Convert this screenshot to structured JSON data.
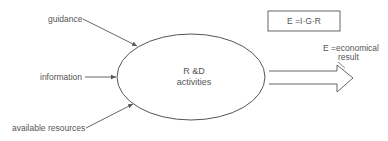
{
  "diagram": {
    "inputs": [
      {
        "id": "guidance",
        "label": "guidance"
      },
      {
        "id": "information",
        "label": "information"
      },
      {
        "id": "available-resources",
        "label": "available resources"
      }
    ],
    "process": {
      "line1": "R &D",
      "line2": "activities"
    },
    "formula": "E =I·G·R",
    "output": {
      "line1": "E =economical",
      "line2": "result"
    },
    "colors": {
      "ink": "#555555",
      "background": "#ffffff"
    }
  }
}
